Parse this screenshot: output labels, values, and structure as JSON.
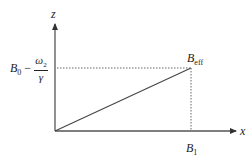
{
  "diagram": {
    "axes": {
      "vertical_label": "z",
      "horizontal_label": "x"
    },
    "labels": {
      "z_value_base": "B",
      "z_value_base_sub": "0",
      "minus": " − ",
      "frac_num": "ω",
      "frac_num_sub": "2",
      "frac_den": "γ",
      "endpoint_base": "B",
      "endpoint_sub": "eff",
      "x_value_base": "B",
      "x_value_sub": "1"
    },
    "colors": {
      "axis": "#555555",
      "vector": "#444444",
      "dotted": "#666666"
    }
  }
}
